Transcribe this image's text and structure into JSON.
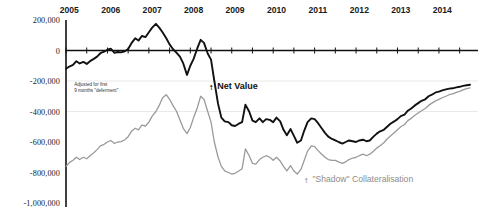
{
  "chart_data": {
    "type": "line",
    "title": "",
    "xlabel": "",
    "ylabel": "",
    "ylim": [
      -1000000,
      200000
    ],
    "xlim": [
      2005.0,
      2014.75
    ],
    "grid": "faint horizontal gridlines at -200,000 and -400,000",
    "zero_axis": true,
    "legend": "inline annotations",
    "ytick_labels": [
      "200,000",
      "0",
      "-200,000",
      "-400,000",
      "-600,000",
      "-800,000",
      "-1,000,000"
    ],
    "ytick_values": [
      200000,
      0,
      -200000,
      -400000,
      -600000,
      -800000,
      -1000000
    ],
    "xtick_labels": [
      "2005",
      "2006",
      "2007",
      "2008",
      "2009",
      "2010",
      "2011",
      "2012",
      "2013",
      "2014"
    ],
    "xtick_values": [
      2005,
      2006,
      2007,
      2008,
      2009,
      2010,
      2011,
      2012,
      2013,
      2014
    ],
    "annotations": [
      {
        "name": "deferment-note",
        "text_line1": "Adjusted for first",
        "text_line2": "9 months \"deferment\"",
        "x": 2005.1,
        "y": -230000
      },
      {
        "name": "net-value-label",
        "text": "Net Value",
        "x": 2008.6,
        "y": -235000
      },
      {
        "name": "shadow-label",
        "text": "\"Shadow\" Collateralisation",
        "x": 2010.9,
        "y": -845000
      }
    ],
    "series": [
      {
        "name": "Net Value",
        "color": "#111111",
        "width": 1.9,
        "x": [
          2005.0,
          2005.08,
          2005.17,
          2005.25,
          2005.33,
          2005.42,
          2005.5,
          2005.58,
          2005.67,
          2005.75,
          2005.83,
          2005.92,
          2006.0,
          2006.08,
          2006.17,
          2006.25,
          2006.33,
          2006.42,
          2006.5,
          2006.58,
          2006.67,
          2006.75,
          2006.83,
          2006.92,
          2007.0,
          2007.08,
          2007.17,
          2007.25,
          2007.33,
          2007.42,
          2007.5,
          2007.58,
          2007.67,
          2007.75,
          2007.83,
          2007.92,
          2008.0,
          2008.08,
          2008.17,
          2008.25,
          2008.33,
          2008.42,
          2008.5,
          2008.58,
          2008.67,
          2008.75,
          2008.83,
          2008.92,
          2009.0,
          2009.08,
          2009.17,
          2009.25,
          2009.33,
          2009.42,
          2009.5,
          2009.58,
          2009.67,
          2009.75,
          2009.83,
          2009.92,
          2010.0,
          2010.08,
          2010.17,
          2010.25,
          2010.33,
          2010.42,
          2010.5,
          2010.58,
          2010.67,
          2010.75,
          2010.83,
          2010.92,
          2011.0,
          2011.08,
          2011.17,
          2011.25,
          2011.33,
          2011.42,
          2011.5,
          2011.58,
          2011.67,
          2011.75,
          2011.83,
          2011.92,
          2012.0,
          2012.08,
          2012.17,
          2012.25,
          2012.33,
          2012.42,
          2012.5,
          2012.58,
          2012.67,
          2012.75,
          2012.83,
          2012.92,
          2013.0,
          2013.08,
          2013.17,
          2013.25,
          2013.33,
          2013.42,
          2013.5,
          2013.58,
          2013.67,
          2013.75,
          2013.83,
          2013.92,
          2014.0,
          2014.08,
          2014.17,
          2014.25,
          2014.33,
          2014.42,
          2014.5,
          2014.58,
          2014.67,
          2014.75
        ],
        "y": [
          -120000,
          -105000,
          -95000,
          -70000,
          -85000,
          -75000,
          -88000,
          -70000,
          -55000,
          -40000,
          -18000,
          -8000,
          5000,
          12000,
          -15000,
          -10000,
          -12000,
          -5000,
          10000,
          48000,
          80000,
          65000,
          95000,
          88000,
          120000,
          150000,
          175000,
          150000,
          120000,
          80000,
          40000,
          10000,
          -15000,
          -40000,
          -85000,
          -160000,
          -100000,
          -55000,
          15000,
          70000,
          50000,
          -20000,
          -60000,
          -200000,
          -350000,
          -440000,
          -465000,
          -470000,
          -490000,
          -495000,
          -480000,
          -470000,
          -355000,
          -400000,
          -460000,
          -470000,
          -445000,
          -470000,
          -450000,
          -455000,
          -470000,
          -440000,
          -465000,
          -520000,
          -555000,
          -515000,
          -560000,
          -605000,
          -590000,
          -525000,
          -470000,
          -445000,
          -450000,
          -475000,
          -510000,
          -540000,
          -565000,
          -580000,
          -590000,
          -600000,
          -610000,
          -600000,
          -590000,
          -595000,
          -600000,
          -590000,
          -585000,
          -595000,
          -590000,
          -565000,
          -545000,
          -530000,
          -520000,
          -500000,
          -480000,
          -465000,
          -450000,
          -430000,
          -420000,
          -395000,
          -380000,
          -360000,
          -345000,
          -330000,
          -320000,
          -300000,
          -290000,
          -275000,
          -270000,
          -262000,
          -255000,
          -250000,
          -248000,
          -242000,
          -238000,
          -232000,
          -228000,
          -225000
        ]
      },
      {
        "name": "\"Shadow\" Collateralisation",
        "color": "#9a9a9a",
        "width": 1.3,
        "x": [
          2005.0,
          2005.08,
          2005.17,
          2005.25,
          2005.33,
          2005.42,
          2005.5,
          2005.58,
          2005.67,
          2005.75,
          2005.83,
          2005.92,
          2006.0,
          2006.08,
          2006.17,
          2006.25,
          2006.33,
          2006.42,
          2006.5,
          2006.58,
          2006.67,
          2006.75,
          2006.83,
          2006.92,
          2007.0,
          2007.08,
          2007.17,
          2007.25,
          2007.33,
          2007.42,
          2007.5,
          2007.58,
          2007.67,
          2007.75,
          2007.83,
          2007.92,
          2008.0,
          2008.08,
          2008.17,
          2008.25,
          2008.33,
          2008.42,
          2008.5,
          2008.58,
          2008.67,
          2008.75,
          2008.83,
          2008.92,
          2009.0,
          2009.08,
          2009.17,
          2009.25,
          2009.33,
          2009.42,
          2009.5,
          2009.58,
          2009.67,
          2009.75,
          2009.83,
          2009.92,
          2010.0,
          2010.08,
          2010.17,
          2010.25,
          2010.33,
          2010.42,
          2010.5,
          2010.58,
          2010.67,
          2010.75,
          2010.83,
          2010.92,
          2011.0,
          2011.08,
          2011.17,
          2011.25,
          2011.33,
          2011.42,
          2011.5,
          2011.58,
          2011.67,
          2011.75,
          2011.83,
          2011.92,
          2012.0,
          2012.08,
          2012.17,
          2012.25,
          2012.33,
          2012.42,
          2012.5,
          2012.58,
          2012.67,
          2012.75,
          2012.83,
          2012.92,
          2013.0,
          2013.08,
          2013.17,
          2013.25,
          2013.33,
          2013.42,
          2013.5,
          2013.58,
          2013.67,
          2013.75,
          2013.83,
          2013.92,
          2014.0,
          2014.08,
          2014.17,
          2014.25,
          2014.33,
          2014.42,
          2014.5,
          2014.58,
          2014.67,
          2014.75
        ],
        "y": [
          -760000,
          -735000,
          -720000,
          -700000,
          -715000,
          -700000,
          -710000,
          -690000,
          -670000,
          -650000,
          -625000,
          -615000,
          -600000,
          -590000,
          -610000,
          -600000,
          -598000,
          -585000,
          -565000,
          -530000,
          -510000,
          -520000,
          -490000,
          -495000,
          -470000,
          -430000,
          -400000,
          -360000,
          -310000,
          -290000,
          -320000,
          -360000,
          -400000,
          -455000,
          -510000,
          -545000,
          -505000,
          -440000,
          -375000,
          -300000,
          -320000,
          -400000,
          -470000,
          -600000,
          -700000,
          -760000,
          -790000,
          -800000,
          -810000,
          -805000,
          -790000,
          -775000,
          -645000,
          -690000,
          -740000,
          -745000,
          -715000,
          -700000,
          -690000,
          -700000,
          -720000,
          -700000,
          -725000,
          -760000,
          -790000,
          -755000,
          -790000,
          -810000,
          -780000,
          -720000,
          -660000,
          -625000,
          -630000,
          -655000,
          -680000,
          -700000,
          -715000,
          -720000,
          -720000,
          -730000,
          -740000,
          -730000,
          -715000,
          -705000,
          -700000,
          -690000,
          -680000,
          -690000,
          -680000,
          -660000,
          -640000,
          -625000,
          -605000,
          -580000,
          -560000,
          -540000,
          -520000,
          -500000,
          -485000,
          -460000,
          -445000,
          -425000,
          -410000,
          -395000,
          -380000,
          -360000,
          -345000,
          -330000,
          -320000,
          -310000,
          -300000,
          -290000,
          -285000,
          -275000,
          -268000,
          -258000,
          -250000,
          -245000
        ]
      }
    ]
  }
}
